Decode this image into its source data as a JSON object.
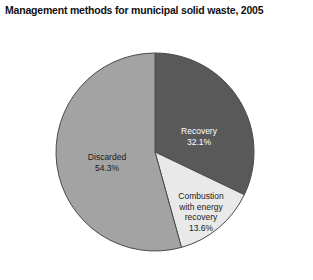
{
  "chart_data": {
    "type": "pie",
    "title": "Management methods for municipal solid waste, 2005",
    "xlabel": "",
    "ylabel": "",
    "legend": "none",
    "grid": false,
    "start_angle_deg": 0,
    "direction": "clockwise",
    "categories": [
      "Recovery",
      "Combustion with energy recovery",
      "Discarded"
    ],
    "values": [
      32.1,
      13.6,
      54.3
    ],
    "units": "percent",
    "slices": [
      {
        "name": "Recovery",
        "label_line1": "Recovery",
        "label_line2": "32.1%",
        "value": 32.1,
        "color": "#59595a",
        "label_color": "#ffffff"
      },
      {
        "name": "Combustion with energy recovery",
        "label_line1": "Combustion",
        "label_line2": "with energy",
        "label_line3": "recovery",
        "label_line4": "13.6%",
        "value": 13.6,
        "color": "#e9e9e9",
        "label_color": "#1b1b1b"
      },
      {
        "name": "Discarded",
        "label_line1": "Discarded",
        "label_line2": "54.3%",
        "value": 54.3,
        "color": "#a3a3a4",
        "label_color": "#1b1b1b"
      }
    ],
    "outline_color": "#4a4a4a",
    "background": "#ffffff"
  },
  "geometry": {
    "center_x": 155,
    "center_y": 152,
    "radius": 99
  }
}
